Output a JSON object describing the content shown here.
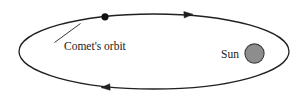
{
  "diagram": {
    "name": "comet-orbit-diagram",
    "background_color": "#ffffff",
    "stroke_color": "#221f1f",
    "labels": {
      "orbit": "Comet's orbit",
      "sun": "Sun"
    },
    "orbit": {
      "shape": "ellipse",
      "center_x": 154,
      "center_y": 51.5,
      "radius_x": 135,
      "radius_y": 37.5,
      "stroke_width": 1.3,
      "fill": "none"
    },
    "comet": {
      "shape": "filled-circle",
      "center_x": 105,
      "center_y": 16.8,
      "radius": 3.6,
      "color": "#121212"
    },
    "sun": {
      "shape": "filled-circle",
      "center_x": 254.5,
      "center_y": 53.5,
      "radius": 9.6,
      "fill_color": "#8d8d8d",
      "stroke_color": "#3c3c3c",
      "stroke_width": 1.1
    },
    "sun_label": {
      "x": 221,
      "y": 57.5,
      "anchor": "start"
    },
    "orbit_label": {
      "x": 64,
      "y": 50,
      "anchor": "start"
    },
    "leader_line": {
      "x1": 80.5,
      "y1": 23.5,
      "x2": 54.5,
      "y2": 42.5,
      "stroke_width": 0.9
    },
    "arrows": [
      {
        "name": "orbit-direction-arrow-top",
        "direction": "right",
        "tip_x": 193,
        "tip_y": 14.3,
        "back_x": 184,
        "back_y": 14.8,
        "half_width": 3.2
      },
      {
        "name": "orbit-direction-arrow-bottom",
        "direction": "left",
        "tip_x": 101,
        "tip_y": 87.6,
        "back_x": 110,
        "back_y": 87.0,
        "half_width": 3.2
      }
    ]
  }
}
